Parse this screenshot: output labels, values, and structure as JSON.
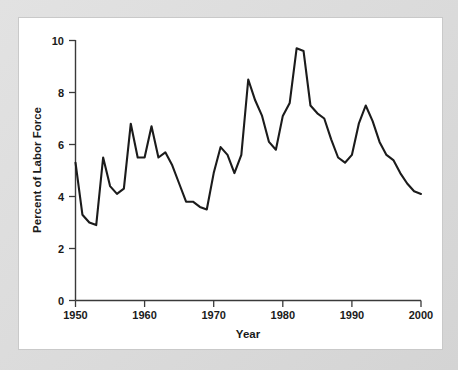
{
  "figure": {
    "background_color": "#d9d9d9",
    "panel_color": "#ffffff",
    "line_color": "#1b1b1b"
  },
  "axes": {
    "x_title": "Year",
    "y_title": "Percent of Labor Force",
    "x_ticks": [
      "1950",
      "1960",
      "1970",
      "1980",
      "1990",
      "2000"
    ],
    "y_ticks": [
      "0",
      "2",
      "4",
      "6",
      "8",
      "10"
    ]
  },
  "chart_data": {
    "type": "line",
    "title": "",
    "subtitle": "",
    "xlabel": "Year",
    "ylabel": "Percent of Labor Force",
    "xlim": [
      1950,
      2000
    ],
    "ylim": [
      0,
      10
    ],
    "xticks": [
      1950,
      1960,
      1970,
      1980,
      1990,
      2000
    ],
    "yticks": [
      0,
      2,
      4,
      6,
      8,
      10
    ],
    "grid": false,
    "legend": false,
    "legend_position": "none",
    "x": [
      1950,
      1951,
      1952,
      1953,
      1954,
      1955,
      1956,
      1957,
      1958,
      1959,
      1960,
      1961,
      1962,
      1963,
      1964,
      1965,
      1966,
      1967,
      1968,
      1969,
      1970,
      1971,
      1972,
      1973,
      1974,
      1975,
      1976,
      1977,
      1978,
      1979,
      1980,
      1981,
      1982,
      1983,
      1984,
      1985,
      1986,
      1987,
      1988,
      1989,
      1990,
      1991,
      1992,
      1993,
      1994,
      1995,
      1996,
      1997,
      1998,
      1999,
      2000
    ],
    "series": [
      {
        "name": "Unemployment rate",
        "values": [
          5.3,
          3.3,
          3.0,
          2.9,
          5.5,
          4.4,
          4.1,
          4.3,
          6.8,
          5.5,
          5.5,
          6.7,
          5.5,
          5.7,
          5.2,
          4.5,
          3.8,
          3.8,
          3.6,
          3.5,
          4.9,
          5.9,
          5.6,
          4.9,
          5.6,
          8.5,
          7.7,
          7.1,
          6.1,
          5.8,
          7.1,
          7.6,
          9.7,
          9.6,
          7.5,
          7.2,
          7.0,
          6.2,
          5.5,
          5.3,
          5.6,
          6.8,
          7.5,
          6.9,
          6.1,
          5.6,
          5.4,
          4.9,
          4.5,
          4.2,
          4.1
        ]
      }
    ]
  }
}
